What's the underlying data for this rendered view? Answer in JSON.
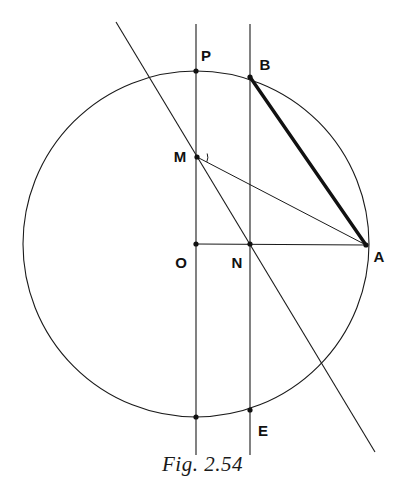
{
  "figure": {
    "caption": "Fig. 2.54",
    "stroke_color": "#1a1a1a",
    "background_color": "#ffffff",
    "circle": {
      "center_x": 196,
      "center_y": 244,
      "radius": 173,
      "stroke_width": 1
    },
    "points": [
      {
        "id": "P",
        "label": "P",
        "x": 196,
        "y": 71,
        "label_x": 206,
        "label_y": 57,
        "dot": true
      },
      {
        "id": "B",
        "label": "B",
        "x": 250,
        "y": 77,
        "label_x": 265,
        "label_y": 66,
        "dot": true
      },
      {
        "id": "M",
        "label": "M",
        "x": 197,
        "y": 157,
        "label_x": 180,
        "label_y": 158,
        "dot": true
      },
      {
        "id": "O",
        "label": "O",
        "x": 196,
        "y": 244,
        "label_x": 181,
        "label_y": 264,
        "dot": true
      },
      {
        "id": "N",
        "label": "N",
        "x": 250,
        "y": 244,
        "label_x": 237,
        "label_y": 264,
        "dot": true
      },
      {
        "id": "A",
        "label": "A",
        "x": 366,
        "y": 245,
        "label_x": 379,
        "label_y": 258,
        "dot": true
      },
      {
        "id": "E",
        "label": "E",
        "x": 250,
        "y": 410,
        "label_x": 263,
        "label_y": 432,
        "dot": true
      },
      {
        "id": "Q",
        "label": "",
        "x": 196,
        "y": 417,
        "label_x": 196,
        "label_y": 417,
        "dot": true
      }
    ],
    "segments": [
      {
        "name": "vertical-line-through-P-O",
        "x1": 196,
        "y1": 24,
        "x2": 196,
        "y2": 455,
        "width": 1.1,
        "bold": false
      },
      {
        "name": "vertical-line-through-B-N-E",
        "x1": 250,
        "y1": 24,
        "x2": 250,
        "y2": 455,
        "width": 1.1,
        "bold": false
      },
      {
        "name": "horizontal-radius-O-A",
        "x1": 196,
        "y1": 244,
        "x2": 366,
        "y2": 245,
        "width": 1.1,
        "bold": false
      },
      {
        "name": "oblique-secant-line",
        "x1": 116,
        "y1": 22,
        "x2": 375,
        "y2": 452,
        "width": 1.1,
        "bold": false
      },
      {
        "name": "chord-M-A",
        "x1": 197,
        "y1": 157,
        "x2": 366,
        "y2": 245,
        "width": 1.0,
        "bold": false
      },
      {
        "name": "chord-B-A-bold",
        "x1": 250,
        "y1": 77,
        "x2": 366,
        "y2": 245,
        "width": 3.4,
        "bold": true
      }
    ],
    "angle_marker": {
      "name": "right-angle-arc-at-M",
      "cx": 197,
      "cy": 157,
      "radius": 11,
      "start_angle_deg": 27,
      "end_angle_deg": 63
    }
  }
}
